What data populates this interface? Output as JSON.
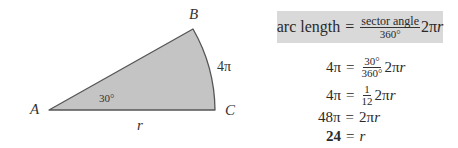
{
  "diagram": {
    "vertices": {
      "a": "A",
      "b": "B",
      "c": "C"
    },
    "angle_label": "30°",
    "arc_label": "4π",
    "radius_label": "r",
    "colors": {
      "fill": "#c4c4c4",
      "stroke": "#555555"
    }
  },
  "formula": {
    "lhs": "arc length",
    "equals": "=",
    "numerator": "sector angle",
    "denominator": "360°",
    "tail": "2π",
    "tail_var": "r",
    "box_color": "#d9d9d9"
  },
  "steps": [
    {
      "lhs": "4π",
      "equals": "=",
      "num": "30°",
      "den": "360°",
      "rest": "2π",
      "var": "r"
    },
    {
      "lhs": "4π",
      "equals": "=",
      "num": "1",
      "den": "12",
      "rest": "2π",
      "var": "r"
    },
    {
      "lhs": "48π",
      "equals": "=",
      "rest": "2π",
      "var": "r"
    },
    {
      "lhs": "24",
      "equals": "=",
      "var": "r"
    }
  ]
}
